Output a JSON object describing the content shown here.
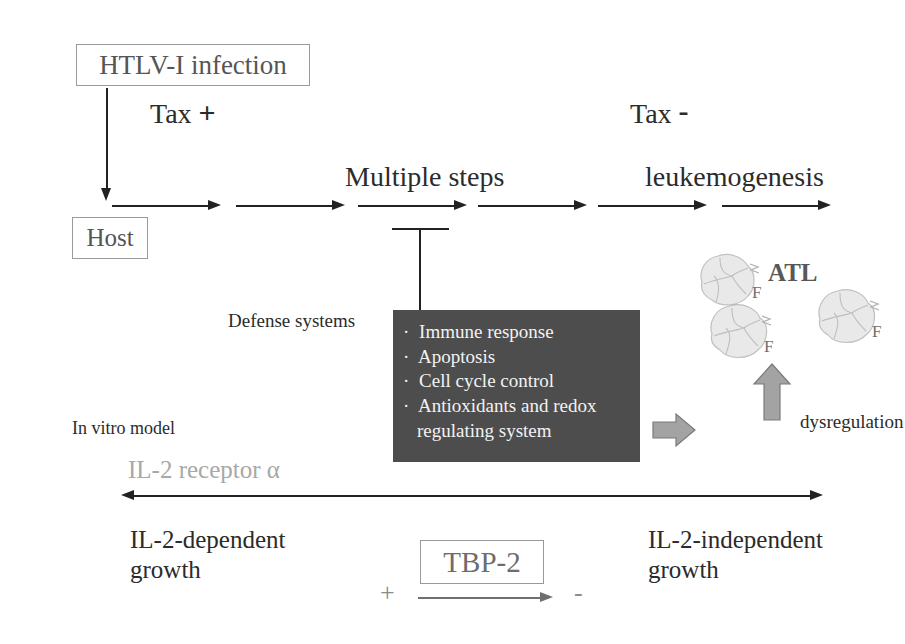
{
  "diagram": {
    "nodes": {
      "htlv_infection": "HTLV-I infection",
      "host": "Host",
      "tbp2": "TBP-2"
    },
    "phase_labels": {
      "tax_positive": "Tax",
      "tax_positive_symbol": "+",
      "tax_negative": "Tax",
      "tax_negative_symbol": "-",
      "multiple_steps": "Multiple steps",
      "leukemogenesis": "leukemogenesis"
    },
    "defense": {
      "caption": "Defense systems",
      "items": [
        "Immune response",
        "Apoptosis",
        "Cell cycle control",
        "Antioxidants and redox",
        "regulating system"
      ],
      "box_color": "#4d4d4d",
      "text_color": "#f2f2f2"
    },
    "outcome": {
      "atl_label": "ATL",
      "dysregulation": "dysregulation",
      "cell_marks": [
        "F",
        "F",
        "F"
      ]
    },
    "in_vitro": {
      "caption": "In vitro model",
      "axis_label": "IL-2 receptor α",
      "axis_label_color": "#a8a8a8",
      "left_state": "IL-2-dependent\ngrowth",
      "left_state_line1": "IL-2-dependent",
      "left_state_line2": "growth",
      "right_state_line1": "IL-2-independent",
      "right_state_line2": "growth",
      "tbp2_plus": "+",
      "tbp2_minus": "-"
    },
    "flow": {
      "arrow_count": 6,
      "arrow_row_y": 205
    },
    "colors": {
      "line": "#222222",
      "box_border": "#9a9a9a",
      "block_arrow_fill": "#a3a3a3",
      "block_arrow_stroke": "#7b7b7b",
      "muted_text": "#a8a8a8"
    }
  }
}
